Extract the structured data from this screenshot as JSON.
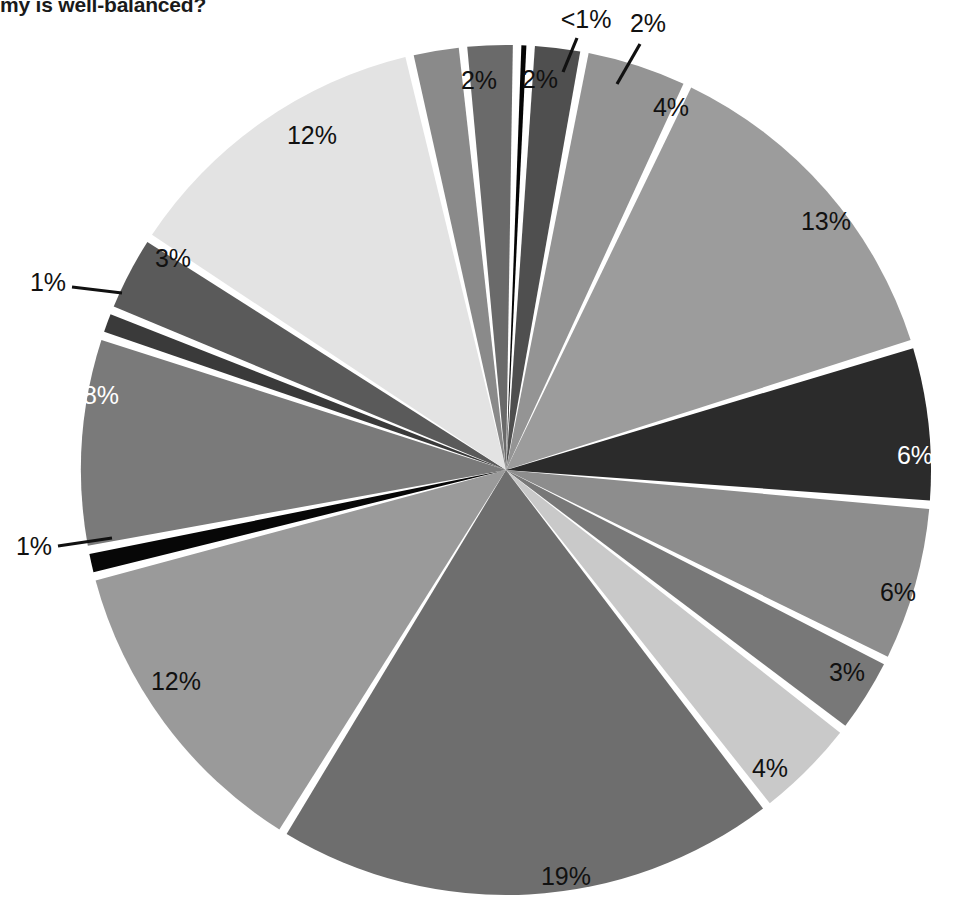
{
  "title": "my is well-balanced?",
  "colors": {
    "background": "#ffffff",
    "separator": "#ffffff",
    "label_dark": "#111111",
    "label_light": "#ffffff",
    "leader_line": "#111111"
  },
  "chart_data": {
    "type": "pie",
    "title": "my is well-balanced?",
    "xlabel": "",
    "ylabel": "",
    "legend_position": "none",
    "grid": false,
    "start_angle_deg": -88.5,
    "direction": "clockwise",
    "center": {
      "x": 506,
      "y": 470
    },
    "radius": 425,
    "gap_deg": 1.15,
    "categories": [
      "slice-01",
      "slice-02",
      "slice-03",
      "slice-04",
      "slice-05",
      "slice-06",
      "slice-07",
      "slice-08",
      "slice-09",
      "slice-10",
      "slice-11",
      "slice-12",
      "slice-13",
      "slice-14",
      "slice-15",
      "slice-16",
      "slice-17"
    ],
    "values": [
      0.5,
      2,
      4,
      13,
      6,
      6,
      3,
      4,
      19,
      12,
      1,
      8,
      1,
      3,
      12,
      2,
      2
    ],
    "labels": [
      "<1%",
      "2%",
      "4%",
      "13%",
      "6%",
      "6%",
      "3%",
      "4%",
      "19%",
      "12%",
      "1%",
      "8%",
      "1%",
      "3%",
      "12%",
      "2%",
      "2%"
    ],
    "slice_colors": [
      "#050505",
      "#4f4f4f",
      "#949494",
      "#9c9c9c",
      "#2b2b2b",
      "#8d8d8d",
      "#787878",
      "#c9c9c9",
      "#6e6e6e",
      "#9a9a9a",
      "#070707",
      "#7a7a7a",
      "#3a3a3a",
      "#5a5a5a",
      "#e3e3e3",
      "#8a8a8a",
      "#6a6a6a"
    ],
    "label_text_colors": [
      "dark",
      "dark",
      "dark",
      "dark",
      "light",
      "dark",
      "dark",
      "dark",
      "dark",
      "dark",
      "dark",
      "light",
      "dark",
      "dark",
      "dark",
      "dark",
      "dark"
    ],
    "callouts": [
      {
        "label": "<1%",
        "slice": "slice-01"
      },
      {
        "label": "2%",
        "slice": "slice-02"
      },
      {
        "label": "1%",
        "slice": "slice-11"
      },
      {
        "label": "1%",
        "slice": "slice-13"
      }
    ]
  },
  "labels_layout": [
    {
      "id": "lbl-lt1",
      "text": "<1%",
      "x": 586,
      "y": 28,
      "anchor": "middle",
      "tone": "dark",
      "callout": true,
      "line": [
        [
          577,
          38
        ],
        [
          563,
          72
        ]
      ]
    },
    {
      "id": "lbl-2a",
      "text": "2%",
      "x": 648,
      "y": 32,
      "anchor": "middle",
      "tone": "dark",
      "callout": true,
      "line": [
        [
          640,
          44
        ],
        [
          617,
          84
        ]
      ]
    },
    {
      "id": "lbl-4a",
      "text": "4%",
      "x": 671,
      "y": 116,
      "anchor": "middle",
      "tone": "dark",
      "callout": false
    },
    {
      "id": "lbl-13",
      "text": "13%",
      "x": 826,
      "y": 230,
      "anchor": "middle",
      "tone": "dark",
      "callout": false
    },
    {
      "id": "lbl-6a",
      "text": "6%",
      "x": 915,
      "y": 464,
      "anchor": "middle",
      "tone": "light",
      "callout": false
    },
    {
      "id": "lbl-6b",
      "text": "6%",
      "x": 898,
      "y": 601,
      "anchor": "middle",
      "tone": "dark",
      "callout": false
    },
    {
      "id": "lbl-3b",
      "text": "3%",
      "x": 847,
      "y": 681,
      "anchor": "middle",
      "tone": "dark",
      "callout": false
    },
    {
      "id": "lbl-4b",
      "text": "4%",
      "x": 770,
      "y": 777,
      "anchor": "middle",
      "tone": "dark",
      "callout": false
    },
    {
      "id": "lbl-19",
      "text": "19%",
      "x": 566,
      "y": 885,
      "anchor": "middle",
      "tone": "dark",
      "callout": false
    },
    {
      "id": "lbl-12b",
      "text": "12%",
      "x": 176,
      "y": 690,
      "anchor": "middle",
      "tone": "dark",
      "callout": false
    },
    {
      "id": "lbl-1b",
      "text": "1%",
      "x": 34,
      "y": 555,
      "anchor": "middle",
      "tone": "dark",
      "callout": true,
      "line": [
        [
          58,
          546
        ],
        [
          112,
          538
        ]
      ]
    },
    {
      "id": "lbl-8",
      "text": "8%",
      "x": 101,
      "y": 404,
      "anchor": "middle",
      "tone": "light",
      "callout": false
    },
    {
      "id": "lbl-1a",
      "text": "1%",
      "x": 48,
      "y": 291,
      "anchor": "middle",
      "tone": "dark",
      "callout": true,
      "line": [
        [
          72,
          287
        ],
        [
          122,
          293
        ]
      ]
    },
    {
      "id": "lbl-3a",
      "text": "3%",
      "x": 173,
      "y": 267,
      "anchor": "middle",
      "tone": "dark",
      "callout": false
    },
    {
      "id": "lbl-12a",
      "text": "12%",
      "x": 312,
      "y": 144,
      "anchor": "middle",
      "tone": "dark",
      "callout": false
    },
    {
      "id": "lbl-2b",
      "text": "2%",
      "x": 479,
      "y": 89,
      "anchor": "middle",
      "tone": "dark",
      "callout": false
    },
    {
      "id": "lbl-2c",
      "text": "2%",
      "x": 540,
      "y": 88,
      "anchor": "middle",
      "tone": "dark",
      "callout": false
    }
  ]
}
